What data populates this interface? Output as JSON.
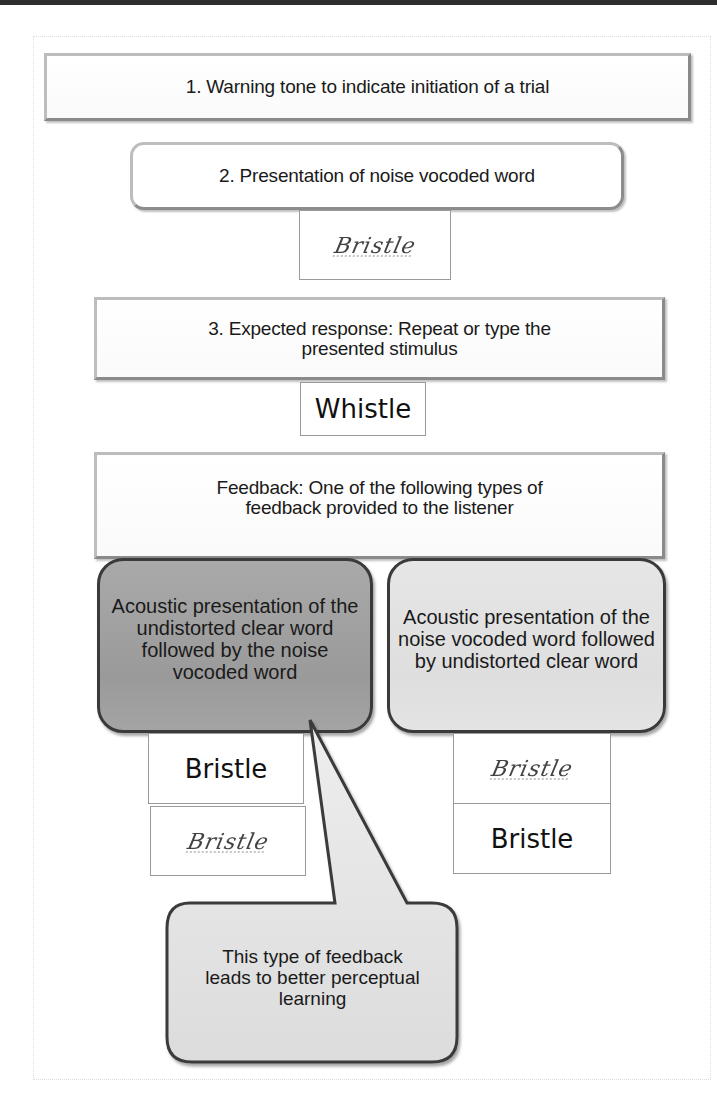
{
  "figure": {
    "steps": [
      {
        "id": "1",
        "label": "1. Warning tone to indicate initiation of a trial"
      },
      {
        "id": "2",
        "label": "2. Presentation of noise vocoded word",
        "stimulus_vocoded": "Bristle"
      },
      {
        "id": "3",
        "label": "3. Expected response: Repeat or type the presented stimulus",
        "response_word": "Whistle"
      },
      {
        "id": "feedback",
        "label": "Feedback: One of the following types of feedback provided to the listener"
      }
    ],
    "feedback_options": [
      {
        "label": "Acoustic presentation of the undistorted clear word followed by the noise vocoded word",
        "sequence": [
          {
            "type": "clear",
            "word": "Bristle"
          },
          {
            "type": "vocoded",
            "word": "Bristle"
          }
        ],
        "shade": "#a0a0a0"
      },
      {
        "label": "Acoustic presentation of the noise vocoded word followed by undistorted clear word",
        "sequence": [
          {
            "type": "vocoded",
            "word": "Bristle"
          },
          {
            "type": "clear",
            "word": "Bristle"
          }
        ],
        "shade": "#e0e0e0"
      }
    ],
    "callout": {
      "label": "This type of feedback leads to better perceptual learning",
      "points_to": "feedback_options.0"
    }
  }
}
